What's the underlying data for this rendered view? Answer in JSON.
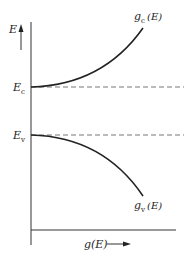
{
  "diagram": {
    "title": "",
    "axes": {
      "y_label": "E",
      "x_label": "g(E)",
      "x_label_arrow": "→"
    },
    "levels": [
      {
        "name": "conduction_band_edge",
        "label_main": "E",
        "label_sub": "c",
        "style": "dashed"
      },
      {
        "name": "valence_band_edge",
        "label_main": "E",
        "label_sub": "v",
        "style": "dashed"
      }
    ],
    "curves": [
      {
        "name": "conduction_density_of_states",
        "label_main": "g",
        "label_sub": "c",
        "label_arg": "(E)",
        "direction": "rises from E_c"
      },
      {
        "name": "valence_density_of_states",
        "label_main": "g",
        "label_sub": "v",
        "label_arg": "(E)",
        "direction": "falls from E_v"
      }
    ],
    "colors": {
      "line": "#222222",
      "dashed": "#777777",
      "background": "#ffffff"
    }
  }
}
